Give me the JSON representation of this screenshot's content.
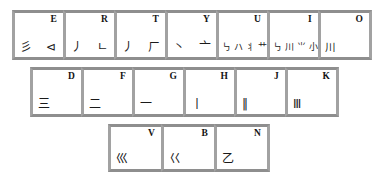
{
  "diagram": {
    "background_color": "#ffffff",
    "key_face_color": "#ffffff",
    "key_border_color": "#9a9a9a",
    "text_color": "#141414"
  },
  "rows": [
    {
      "name": "top-row",
      "keys": [
        {
          "letter": "E",
          "strokes": "彡 ⊲"
        },
        {
          "letter": "R",
          "strokes": "丿 ㄴ"
        },
        {
          "letter": "T",
          "strokes": "丿 ㄏ"
        },
        {
          "letter": "Y",
          "strokes": "丶 亠"
        },
        {
          "letter": "U",
          "strokes": "㇉ ハ 丬 艹"
        },
        {
          "letter": "I",
          "strokes": "㇉ 川 ⺌ 小"
        },
        {
          "letter": "O",
          "strokes": "川"
        }
      ]
    },
    {
      "name": "home-row",
      "keys": [
        {
          "letter": "D",
          "strokes": "三"
        },
        {
          "letter": "F",
          "strokes": "二"
        },
        {
          "letter": "G",
          "strokes": "一"
        },
        {
          "letter": "H",
          "strokes": "丨"
        },
        {
          "letter": "J",
          "strokes": "‖"
        },
        {
          "letter": "K",
          "strokes": "Ⅲ"
        }
      ]
    },
    {
      "name": "bottom-row",
      "keys": [
        {
          "letter": "V",
          "strokes": "巛"
        },
        {
          "letter": "B",
          "strokes": "巜"
        },
        {
          "letter": "N",
          "strokes": "乙"
        }
      ]
    }
  ]
}
